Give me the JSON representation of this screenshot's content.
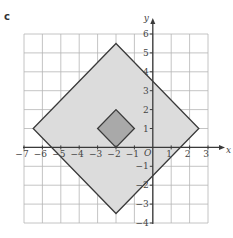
{
  "part_label": "c",
  "axes": {
    "x_label": "x",
    "y_label": "y",
    "origin_label": "O",
    "x_range": [
      -7,
      3
    ],
    "y_range": [
      -4,
      6
    ],
    "x_ticks": [
      {
        "value": -7,
        "label": "−7"
      },
      {
        "value": -6,
        "label": "−6"
      },
      {
        "value": -5,
        "label": "−5"
      },
      {
        "value": -4,
        "label": "−4"
      },
      {
        "value": -3,
        "label": "−3"
      },
      {
        "value": -2,
        "label": "−2"
      },
      {
        "value": -1,
        "label": "−1"
      },
      {
        "value": 1,
        "label": "1"
      },
      {
        "value": 2,
        "label": "2"
      },
      {
        "value": 3,
        "label": "3"
      }
    ],
    "y_ticks": [
      {
        "value": 6,
        "label": "6"
      },
      {
        "value": 5,
        "label": "5"
      },
      {
        "value": 4,
        "label": "4"
      },
      {
        "value": 3,
        "label": "3"
      },
      {
        "value": 2,
        "label": "2"
      },
      {
        "value": 1,
        "label": "1"
      },
      {
        "value": -1,
        "label": "−1"
      },
      {
        "value": -2,
        "label": "−2"
      },
      {
        "value": -3,
        "label": "−3"
      },
      {
        "value": -4,
        "label": "−4"
      }
    ],
    "grid": true
  },
  "shapes": [
    {
      "name": "large-square-enlargement",
      "vertices": [
        [
          -2,
          5.5
        ],
        [
          2.5,
          1
        ],
        [
          -2,
          -3.5
        ],
        [
          -6.5,
          1
        ]
      ],
      "fill": "#dcdcdc",
      "stroke": "#3a3a3a"
    },
    {
      "name": "small-square-object",
      "vertices": [
        [
          -2,
          2
        ],
        [
          -1,
          1
        ],
        [
          -2,
          0
        ],
        [
          -3,
          1
        ]
      ],
      "fill": "#a9a9a9",
      "stroke": "#3a3a3a"
    }
  ],
  "colors": {
    "grid": "#b5b5b5",
    "axis": "#3a3a3a",
    "text": "#444444"
  }
}
